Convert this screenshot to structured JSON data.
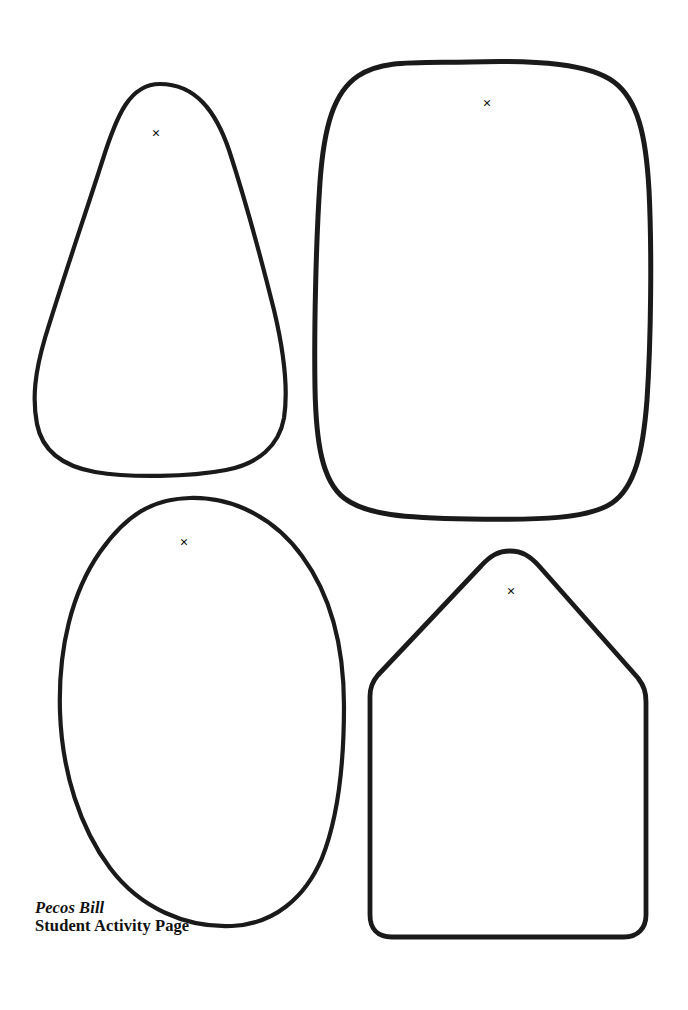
{
  "page": {
    "title": "Pecos Bill",
    "subtitle": "Student Activity Page",
    "background_color": "#ffffff",
    "ink_color": "#1a1a1a",
    "width": 688,
    "height": 1010
  },
  "caption": {
    "line1": "Pecos Bill",
    "line2": "Student Activity Page"
  },
  "shapes": [
    {
      "id": "shape-teardrop",
      "name": "teardrop-outline",
      "label": "Teardrop shape outline",
      "stroke_width": 4.2,
      "path": "M 160 84 C 196 84 216 112 229 150 C 244 196 262 262 274 310 C 284 352 288 392 284 418 C 279 446 258 464 226 470 C 190 477 130 478 95 472 C 62 466 42 450 37 424 C 32 398 35 372 45 338 C 62 282 86 212 102 162 C 117 114 130 84 160 84 Z",
      "mark": {
        "glyph": "×",
        "x": 156,
        "y": 138
      }
    },
    {
      "id": "shape-squircle",
      "name": "rounded-rectangle-outline",
      "label": "Large rounded rectangle outline",
      "stroke_width": 5.0,
      "path": "M 470 62 C 540 60 590 64 614 82 C 638 100 646 136 649 190 C 652 250 651 340 647 400 C 643 452 635 487 612 503 C 588 519 540 520 470 519 C 404 518 366 515 344 498 C 322 481 316 442 315 388 C 314 330 316 240 320 182 C 324 126 334 92 358 76 C 382 60 412 63 470 62 Z",
      "mark": {
        "glyph": "×",
        "x": 487,
        "y": 108
      }
    },
    {
      "id": "shape-egg",
      "name": "egg-oval-outline",
      "label": "Egg shaped oval outline",
      "stroke_width": 4.2,
      "path": "M 190 498 C 236 497 276 520 302 556 C 330 594 344 646 344 706 C 344 766 338 818 322 858 C 305 898 274 924 232 926 C 186 928 140 908 110 868 C 80 828 62 772 60 712 C 58 648 72 592 100 552 C 126 515 152 499 190 498 Z",
      "mark": {
        "glyph": "×",
        "x": 184,
        "y": 547
      }
    },
    {
      "id": "shape-house",
      "name": "house-pentagon-outline",
      "label": "House or pentagon shape outline",
      "stroke_width": 4.8,
      "path": "M 510 551 C 522 551 530 556 539 566 L 638 678 C 644 686 646 692 646 702 L 646 915 C 646 928 638 937 624 937 L 392 937 C 377 937 370 928 370 915 L 370 696 C 370 688 372 682 378 675 L 481 566 C 490 556 498 551 510 551 Z",
      "mark": {
        "glyph": "×",
        "x": 511,
        "y": 596
      }
    }
  ]
}
